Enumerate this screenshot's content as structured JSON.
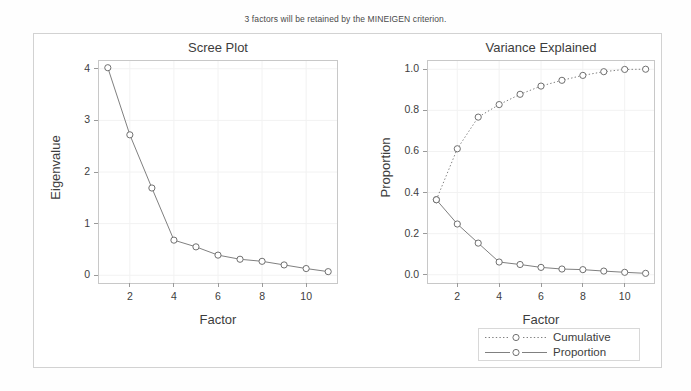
{
  "note": "3 factors will be retained by the MINEIGEN criterion.",
  "colors": {
    "line": "#808080",
    "marker_stroke": "#707070",
    "axis": "#c8c8c8",
    "tick": "#9a9a9a",
    "grid": "#f2f2f2",
    "text": "#3d3d3d",
    "frame": "#d2d2d2",
    "background": "#ffffff"
  },
  "legend": {
    "items": [
      {
        "label": "Cumulative",
        "style": "dotted",
        "marker": "open-circle"
      },
      {
        "label": "Proportion",
        "style": "solid",
        "marker": "open-circle"
      }
    ]
  },
  "chart_data": [
    {
      "type": "line",
      "title": "Scree Plot",
      "xlabel": "Factor",
      "ylabel": "Eigenvalue",
      "x": [
        1,
        2,
        3,
        4,
        5,
        6,
        7,
        8,
        9,
        10,
        11
      ],
      "values": [
        4.02,
        2.72,
        1.69,
        0.68,
        0.55,
        0.39,
        0.31,
        0.27,
        0.2,
        0.13,
        0.07
      ],
      "xlim": [
        0.6,
        11.4
      ],
      "ylim": [
        -0.15,
        4.15
      ],
      "xticks": [
        2,
        4,
        6,
        8,
        10
      ],
      "yticks": [
        0,
        1,
        2,
        3,
        4
      ],
      "xtick_labels": [
        "2",
        "4",
        "6",
        "8",
        "10"
      ],
      "ytick_labels": [
        "0",
        "1",
        "2",
        "3",
        "4"
      ],
      "grid": true,
      "legend": "none",
      "marker": "open-circle",
      "linestyle": "solid"
    },
    {
      "type": "line",
      "title": "Variance Explained",
      "xlabel": "Factor",
      "ylabel": "Proportion",
      "x": [
        1,
        2,
        3,
        4,
        5,
        6,
        7,
        8,
        9,
        10,
        11
      ],
      "series": [
        {
          "name": "Cumulative",
          "values": [
            0.365,
            0.613,
            0.767,
            0.828,
            0.878,
            0.918,
            0.946,
            0.97,
            0.988,
            0.999,
            1.0
          ],
          "linestyle": "dotted",
          "marker": "open-circle"
        },
        {
          "name": "Proportion",
          "values": [
            0.365,
            0.247,
            0.154,
            0.062,
            0.05,
            0.036,
            0.028,
            0.025,
            0.018,
            0.012,
            0.007
          ],
          "linestyle": "solid",
          "marker": "open-circle"
        }
      ],
      "xlim": [
        0.6,
        11.4
      ],
      "ylim": [
        -0.04,
        1.04
      ],
      "xticks": [
        2,
        4,
        6,
        8,
        10
      ],
      "yticks": [
        0.0,
        0.2,
        0.4,
        0.6,
        0.8,
        1.0
      ],
      "xtick_labels": [
        "2",
        "4",
        "6",
        "8",
        "10"
      ],
      "ytick_labels": [
        "0.0",
        "0.2",
        "0.4",
        "0.6",
        "0.8",
        "1.0"
      ],
      "grid": true,
      "legend": "below"
    }
  ]
}
